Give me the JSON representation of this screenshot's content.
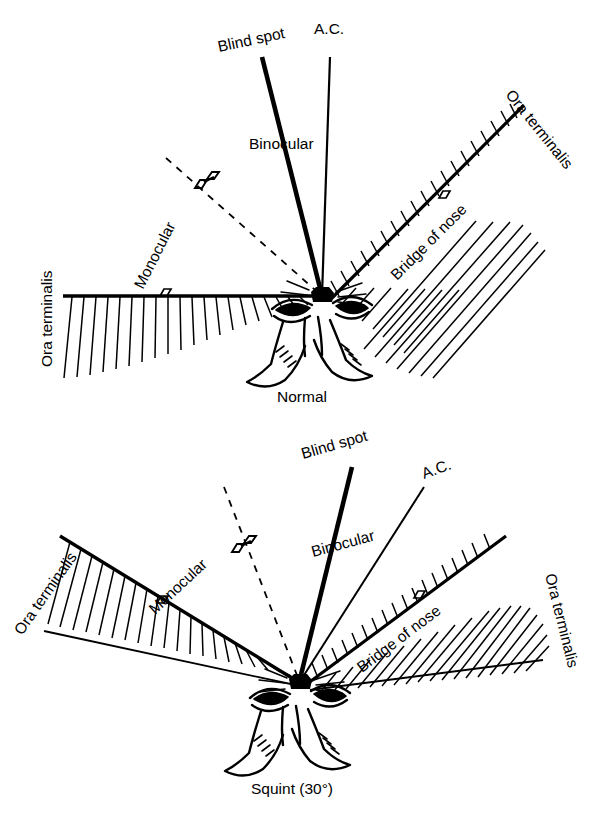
{
  "figure": {
    "title": "",
    "panels": [
      {
        "id": "normal",
        "caption": "Normal",
        "labels": {
          "blind_spot": "Blind spot",
          "ac": "A.C.",
          "binocular": "Binocular",
          "monocular": "Monocular",
          "ora_left": "Ora terminalis",
          "ora_right": "Ora terminalis",
          "bridge": "Bridge of nose"
        }
      },
      {
        "id": "squint",
        "caption": "Squint (30°)",
        "labels": {
          "blind_spot": "Blind spot",
          "ac": "A.C.",
          "binocular": "Binocular",
          "monocular": "Monocular",
          "ora_left": "Ora terminalis",
          "ora_right": "Ora terminalis",
          "bridge": "Bridge of nose"
        }
      }
    ]
  },
  "style": {
    "ink": "#000000",
    "paper": "#ffffff"
  }
}
